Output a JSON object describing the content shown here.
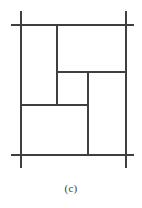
{
  "figure": {
    "caption": "(c)",
    "line_color": "#3f3f3f",
    "background_color": "#ffffff",
    "frame": {
      "left": 21,
      "right": 126,
      "top": 25,
      "bottom": 155,
      "overshoot": 13
    },
    "segments": [
      {
        "name": "frame-top",
        "orientation": "horizontal",
        "x1": 11,
        "y1": 25,
        "x2": 134,
        "y2": 25,
        "width": 1.6
      },
      {
        "name": "frame-bottom",
        "orientation": "horizontal",
        "x1": 11,
        "y1": 155,
        "x2": 134,
        "y2": 155,
        "width": 1.6
      },
      {
        "name": "frame-left",
        "orientation": "vertical",
        "x1": 21,
        "y1": 11,
        "x2": 21,
        "y2": 168,
        "width": 1.6
      },
      {
        "name": "frame-right",
        "orientation": "vertical",
        "x1": 126,
        "y1": 11,
        "x2": 126,
        "y2": 168,
        "width": 1.6
      },
      {
        "name": "divider-upper-vertical",
        "orientation": "vertical",
        "x1": 57,
        "y1": 25,
        "x2": 57,
        "y2": 105,
        "width": 1.4
      },
      {
        "name": "divider-middle-horizontal",
        "orientation": "horizontal",
        "x1": 57,
        "y1": 72,
        "x2": 126,
        "y2": 72,
        "width": 1.4
      },
      {
        "name": "divider-center-vertical",
        "orientation": "vertical",
        "x1": 88,
        "y1": 72,
        "x2": 88,
        "y2": 155,
        "width": 1.4
      },
      {
        "name": "divider-lower-horizontal",
        "orientation": "horizontal",
        "x1": 21,
        "y1": 105,
        "x2": 88,
        "y2": 105,
        "width": 1.4
      }
    ],
    "regions": [
      {
        "name": "region-left-tall",
        "x": 21,
        "y": 25,
        "w": 36,
        "h": 80
      },
      {
        "name": "region-top-right",
        "x": 57,
        "y": 25,
        "w": 69,
        "h": 47
      },
      {
        "name": "region-center",
        "x": 57,
        "y": 72,
        "w": 31,
        "h": 33
      },
      {
        "name": "region-right-tall",
        "x": 88,
        "y": 72,
        "w": 38,
        "h": 83
      },
      {
        "name": "region-bottom-left",
        "x": 21,
        "y": 105,
        "w": 67,
        "h": 50
      }
    ]
  }
}
